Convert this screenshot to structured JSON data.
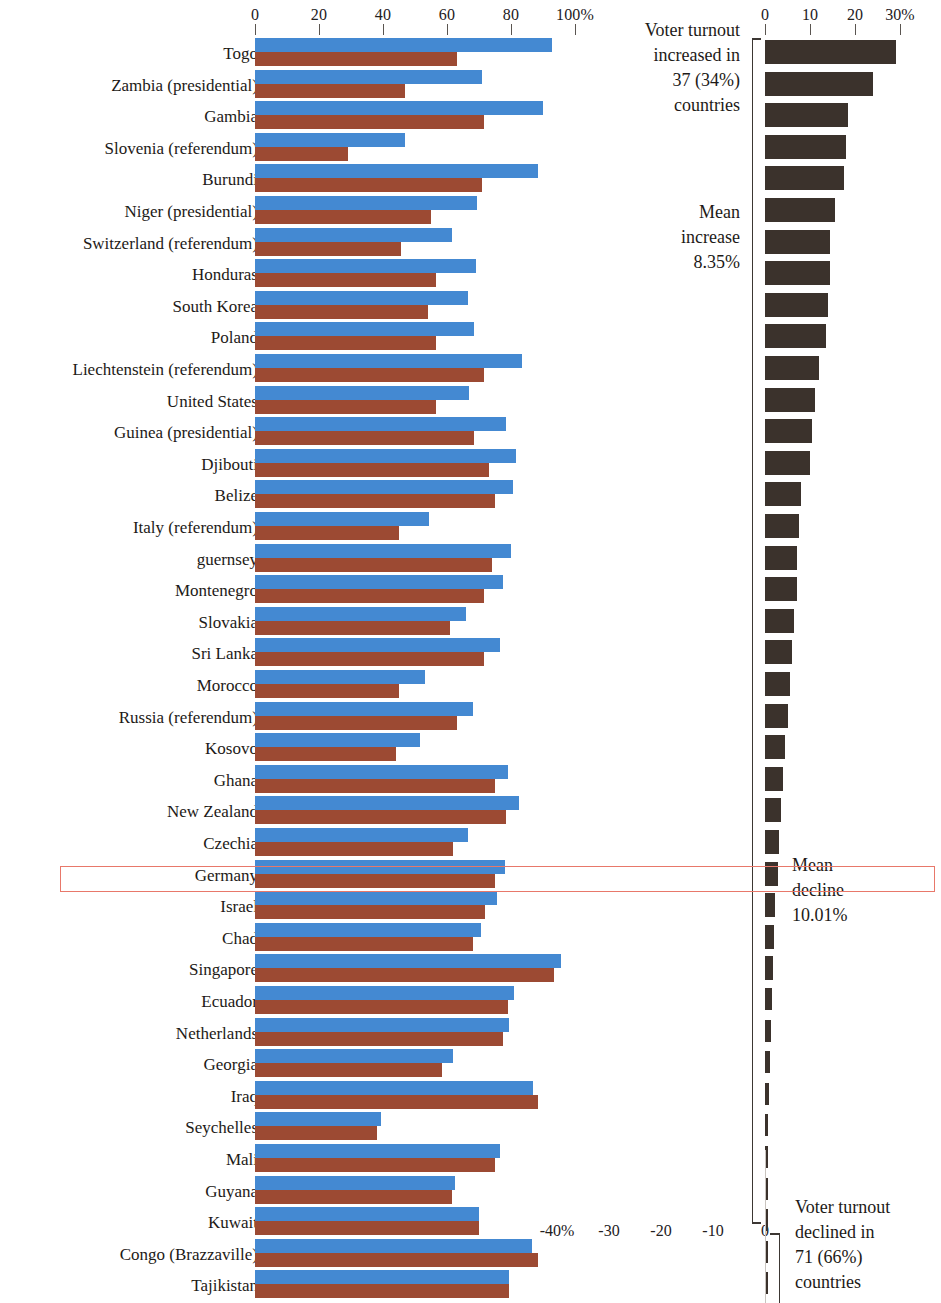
{
  "chart_data": {
    "type": "bar",
    "title": "",
    "subtitle": "",
    "xlabel": "",
    "ylabel": "",
    "left_panel": {
      "axis_ticks": [
        0,
        20,
        40,
        60,
        80,
        100
      ],
      "axis_tick_labels": [
        "0",
        "20",
        "40",
        "60",
        "80",
        "100%"
      ],
      "xlim": [
        0,
        100
      ],
      "grid": false,
      "series": [
        {
          "name": "earlier election turnout",
          "color": "#4489d2"
        },
        {
          "name": "later election turnout",
          "color": "#9c4a33"
        }
      ]
    },
    "right_panel": {
      "axis_ticks": [
        0,
        10,
        20,
        30
      ],
      "axis_tick_labels": [
        "0",
        "10",
        "20",
        "30%"
      ],
      "xlim": [
        0,
        30
      ],
      "grid": false,
      "series": [
        {
          "name": "change in turnout",
          "color": "#3b322c"
        }
      ]
    },
    "bottom_axis": {
      "axis_ticks": [
        -40,
        -30,
        -20,
        -10,
        0
      ],
      "axis_tick_labels": [
        "-40%",
        "-30",
        "-20",
        "-10",
        "0"
      ],
      "xlim": [
        -40,
        0
      ]
    },
    "categories": [
      "Togo",
      "Zambia (presidential)",
      "Gambia",
      "Slovenia (referendum)",
      "Burundi",
      "Niger (presidential)",
      "Switzerland (referendum)",
      "Honduras",
      "South Korea",
      "Poland",
      "Liechtenstein (referendum)",
      "United States",
      "Guinea (presidential)",
      "Djibouti",
      "Belize",
      "Italy (referendum)",
      "guernsey",
      "Montenegro",
      "Slovakia",
      "Sri Lanka",
      "Morocco",
      "Russia (referendum)",
      "Kosovo",
      "Ghana",
      "New Zealand",
      "Czechia",
      "Germany",
      "Israel",
      "Chad",
      "Singapore",
      "Ecuador",
      "Netherlands",
      "Georgia",
      "Iraq",
      "Seychelles",
      "Mali",
      "Guyana",
      "Kuwait",
      "Congo (Brazzaville)",
      "Tajikistan"
    ],
    "series_blue": [
      92.8,
      71.0,
      90.0,
      47.0,
      88.5,
      69.5,
      61.5,
      69.0,
      66.5,
      68.5,
      83.5,
      67.0,
      78.5,
      81.5,
      80.5,
      54.5,
      80.0,
      77.5,
      66.0,
      76.5,
      53.0,
      68.0,
      51.5,
      79.0,
      82.5,
      66.5,
      78.0,
      75.5,
      70.5,
      95.5,
      81.0,
      79.5,
      62.0,
      87.0,
      39.5,
      76.5,
      62.5,
      70.0,
      86.5,
      79.5
    ],
    "series_brown": [
      63.0,
      47.0,
      71.5,
      29.0,
      71.0,
      55.0,
      45.5,
      56.5,
      54.0,
      56.5,
      71.5,
      56.5,
      68.5,
      73.0,
      75.0,
      45.0,
      74.0,
      71.5,
      61.0,
      71.5,
      45.0,
      63.0,
      44.0,
      75.0,
      78.5,
      62.0,
      75.0,
      72.0,
      68.0,
      93.5,
      79.0,
      77.5,
      58.5,
      88.5,
      38.0,
      75.0,
      61.5,
      70.0,
      88.5,
      79.5
    ],
    "series_change": [
      29.0,
      24.0,
      18.5,
      18.0,
      17.5,
      15.5,
      14.5,
      14.5,
      14.0,
      13.5,
      12.0,
      11.0,
      10.5,
      10.0,
      8.0,
      7.5,
      7.0,
      7.0,
      6.5,
      6.0,
      5.5,
      5.0,
      4.5,
      4.0,
      3.5,
      3.0,
      2.8,
      2.3,
      2.0,
      1.8,
      1.6,
      1.3,
      1.0,
      0.8,
      0.6,
      0.5,
      0.4,
      0.3,
      0.2,
      0.1
    ]
  },
  "annotations": {
    "increase_note": "Voter turnout\nincreased in\n37 (34%)\ncountries",
    "mean_increase_note": "Mean\nincrease\n8.35%",
    "mean_decline_note": "Mean\ndecline\n10.01%",
    "decline_note": "Voter turnout\ndeclined in\n71 (66%)\ncountries"
  },
  "highlight": {
    "row": "Germany",
    "color": "#e8786a"
  },
  "colors": {
    "blue": "#4489d2",
    "brown": "#9c4a33",
    "dark": "#3b322c",
    "axis": "#5a5550",
    "highlight": "#e8786a"
  }
}
